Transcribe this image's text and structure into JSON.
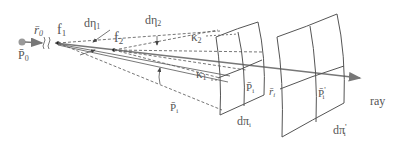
{
  "diagram": {
    "labels": {
      "r0": "r̄",
      "r0_sub": "0",
      "p0": "P̄",
      "p0_sub": "0",
      "f1": "f",
      "f1_sub": "1",
      "f2": "f",
      "f2_sub": "2",
      "deta1": "dη",
      "deta1_sub": "1",
      "deta2": "dη",
      "deta2_sub": "2",
      "kappa2": "κ",
      "kappa2_sub": "2",
      "kappa1": "κ",
      "kappa1_sub": "1",
      "pi_left": "P̄",
      "pi_left_sub": "i",
      "pi_surface": "P̄",
      "pi_surface_sub": "i",
      "ri": "r̄",
      "ri_sub": "i",
      "pi_prime": "P̄",
      "pi_prime_sup": "'",
      "pi_prime_sub": "i",
      "dpi": "dπ",
      "dpi_sub": "i",
      "dpi_prime": "dπ",
      "dpi_prime_sup": "'",
      "dpi_prime_sub": "i",
      "ray": "ray"
    },
    "colors": {
      "stroke": "#555555",
      "ray": "#777777",
      "text": "#555555"
    }
  }
}
